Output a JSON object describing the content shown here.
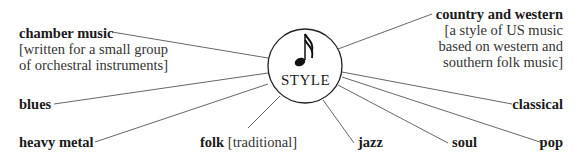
{
  "center": {
    "label": "STYLE",
    "icon": "music-note-icon"
  },
  "items": [
    {
      "term": "chamber music",
      "gloss": "[written for a small group of orchestral instruments]",
      "gloss_lines": [
        "[written for a small group",
        "of orchestral instruments]"
      ]
    },
    {
      "term": "country and western",
      "gloss": "[a style of US music based on western and southern folk music]",
      "gloss_lines": [
        "[a style of US music",
        "based on western and",
        "southern folk music]"
      ]
    },
    {
      "term": "blues"
    },
    {
      "term": "classical"
    },
    {
      "term": "heavy metal"
    },
    {
      "term": "folk",
      "gloss": "[traditional]"
    },
    {
      "term": "jazz"
    },
    {
      "term": "soul"
    },
    {
      "term": "pop"
    }
  ],
  "colors": {
    "text": "#1a1a1a",
    "line": "#444444",
    "background": "#ffffff"
  }
}
